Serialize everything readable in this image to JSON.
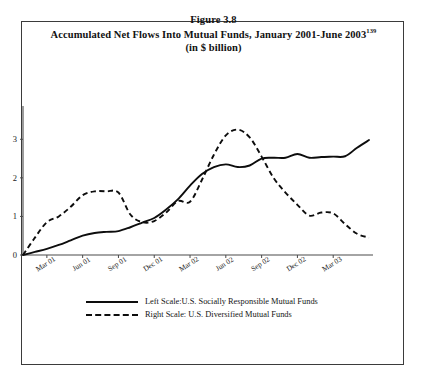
{
  "figure": {
    "number_label": "Figure 3.8",
    "caption_text": "Accumulated Net Flows Into Mutual Funds, January 2001-June 2003",
    "caption_footnote": "139",
    "units_label": "(in $ billion)"
  },
  "legend": {
    "position": "below-plot",
    "entries": [
      {
        "style": "solid",
        "label": "Left Scale:U.S. Socially Responsible Mutual Funds"
      },
      {
        "style": "dashed",
        "label": "Right Scale: U.S. Diversified Mutual Funds"
      }
    ]
  },
  "chart_data": {
    "type": "line",
    "title": "Accumulated Net Flows Into Mutual Funds, January 2001-June 2003",
    "subtitle": "(in $ billion)",
    "xlabel": "",
    "ylabel": "",
    "ylim": [
      0,
      3.5
    ],
    "yticks": [
      0,
      1,
      2,
      3
    ],
    "ytick_labels": [
      "0",
      "1",
      "2",
      "3"
    ],
    "grid": false,
    "legend_position": "below",
    "xtick_labels": [
      "Mar 01",
      "Jun 01",
      "Sep 01",
      "Dec 01",
      "Mar 02",
      "Jun 02",
      "Sep 02",
      "Dec 02",
      "Mar 03"
    ],
    "xtick_indices": [
      2,
      5,
      8,
      11,
      14,
      17,
      20,
      23,
      26
    ],
    "xtick_rotation_deg": -32,
    "x": [
      "Jan 01",
      "Feb 01",
      "Mar 01",
      "Apr 01",
      "May 01",
      "Jun 01",
      "Jul 01",
      "Aug 01",
      "Sep 01",
      "Oct 01",
      "Nov 01",
      "Dec 01",
      "Jan 02",
      "Feb 02",
      "Mar 02",
      "Apr 02",
      "May 02",
      "Jun 02",
      "Jul 02",
      "Aug 02",
      "Sep 02",
      "Oct 02",
      "Nov 02",
      "Dec 02",
      "Jan 03",
      "Feb 03",
      "Mar 03",
      "Apr 03",
      "May 03",
      "Jun 03"
    ],
    "series": [
      {
        "name": "Left Scale:U.S. Socially Responsible Mutual Funds",
        "style": "solid",
        "values": [
          0.0,
          0.08,
          0.16,
          0.26,
          0.38,
          0.5,
          0.57,
          0.6,
          0.62,
          0.72,
          0.84,
          0.96,
          1.18,
          1.45,
          1.8,
          2.1,
          2.28,
          2.35,
          2.28,
          2.32,
          2.5,
          2.52,
          2.52,
          2.62,
          2.52,
          2.54,
          2.55,
          2.56,
          2.78,
          2.98
        ]
      },
      {
        "name": "Right Scale: U.S. Diversified Mutual Funds",
        "style": "dashed",
        "values": [
          0.0,
          0.45,
          0.85,
          1.0,
          1.25,
          1.55,
          1.65,
          1.65,
          1.62,
          1.05,
          0.85,
          0.88,
          1.1,
          1.4,
          1.38,
          1.95,
          2.6,
          3.1,
          3.25,
          3.05,
          2.55,
          2.0,
          1.62,
          1.3,
          1.02,
          1.1,
          1.08,
          0.8,
          0.55,
          0.45
        ]
      }
    ]
  }
}
